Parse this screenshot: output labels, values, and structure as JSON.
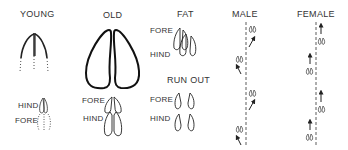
{
  "diagram": {
    "panels": [
      {
        "id": "young",
        "title": "YOUNG",
        "labels": [
          "HIND",
          "FORE"
        ]
      },
      {
        "id": "old",
        "title": "OLD",
        "labels": [
          "FORE",
          "HIND"
        ]
      },
      {
        "id": "fat",
        "title": "FAT",
        "labels": [
          "FORE",
          "HIND"
        ]
      },
      {
        "id": "run-out",
        "title": "RUN OUT",
        "labels": [
          "FORE",
          "HIND"
        ]
      },
      {
        "id": "male",
        "title": "MALE",
        "track": "alternating prints offset left/right of center line with diagonal arrows"
      },
      {
        "id": "female",
        "title": "FEMALE",
        "track": "alternating prints offset left/right of center line with vertical arrows"
      }
    ]
  }
}
